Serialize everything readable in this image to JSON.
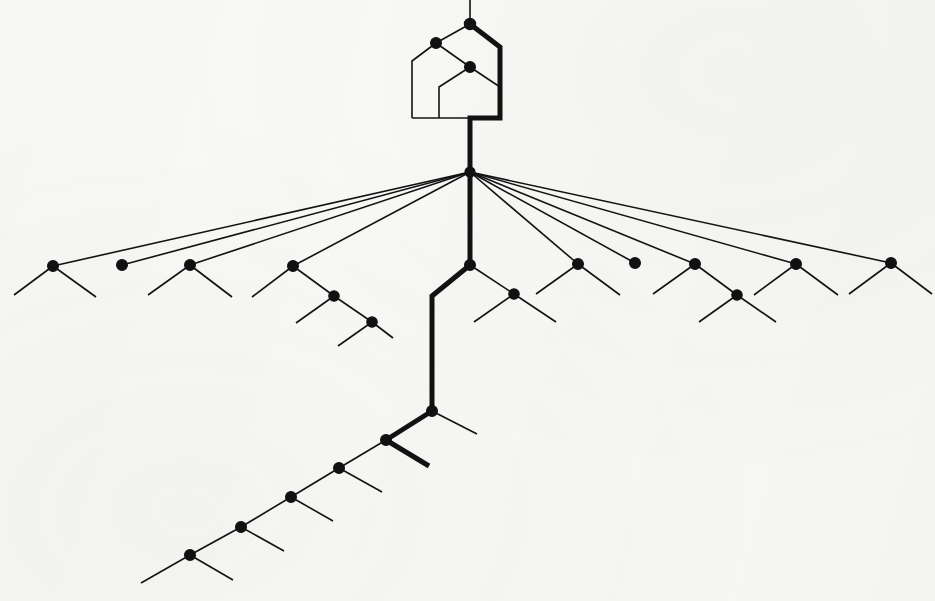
{
  "figure": {
    "title": "Hierarchical branching tree diagram",
    "background_color": "#f9f9f7",
    "ink_color": "#121212",
    "node_color": "#111111",
    "width": 935,
    "height": 601
  },
  "chart_data": {
    "type": "diagram",
    "title": "Hierarchical branching tree diagram",
    "subtitle": "",
    "xlabel": "",
    "ylabel": "",
    "grid": false,
    "legend_position": "none",
    "annotations": [],
    "style": {
      "thin_stroke_width": 1.6,
      "bold_stroke_width": 5.0,
      "node_radius": 5.2,
      "line_cap": "butt",
      "line_join": "miter"
    },
    "nodes": [
      {
        "id": "n_top",
        "x": 470,
        "y": 24,
        "label": "",
        "filled": true,
        "radius": 5.6
      },
      {
        "id": "n_upper_left",
        "x": 436,
        "y": 43,
        "label": "",
        "filled": true,
        "radius": 5.4
      },
      {
        "id": "n_upper_mid",
        "x": 470,
        "y": 67,
        "label": "",
        "filled": true,
        "radius": 5.4
      },
      {
        "id": "n_hub",
        "x": 470,
        "y": 172,
        "label": "",
        "filled": true,
        "radius": 5.0
      },
      {
        "id": "f1",
        "x": 53,
        "y": 266,
        "label": "",
        "filled": true,
        "radius": 5.4
      },
      {
        "id": "f2",
        "x": 122,
        "y": 265,
        "label": "",
        "filled": true,
        "radius": 5.4
      },
      {
        "id": "f3",
        "x": 190,
        "y": 265,
        "label": "",
        "filled": true,
        "radius": 5.4
      },
      {
        "id": "f4",
        "x": 293,
        "y": 266,
        "label": "",
        "filled": true,
        "radius": 5.4
      },
      {
        "id": "f4b",
        "x": 334,
        "y": 296,
        "label": "",
        "filled": true,
        "radius": 5.2
      },
      {
        "id": "f4c",
        "x": 372,
        "y": 322,
        "label": "",
        "filled": true,
        "radius": 5.2
      },
      {
        "id": "c1",
        "x": 470,
        "y": 265,
        "label": "",
        "filled": true,
        "radius": 5.4
      },
      {
        "id": "r1",
        "x": 514,
        "y": 294,
        "label": "",
        "filled": true,
        "radius": 5.2
      },
      {
        "id": "r2",
        "x": 578,
        "y": 264,
        "label": "",
        "filled": true,
        "radius": 5.4
      },
      {
        "id": "r3",
        "x": 635,
        "y": 263,
        "label": "",
        "filled": true,
        "radius": 5.4
      },
      {
        "id": "r4",
        "x": 695,
        "y": 264,
        "label": "",
        "filled": true,
        "radius": 5.4
      },
      {
        "id": "r4b",
        "x": 737,
        "y": 295,
        "label": "",
        "filled": true,
        "radius": 5.2
      },
      {
        "id": "r5",
        "x": 796,
        "y": 264,
        "label": "",
        "filled": true,
        "radius": 5.4
      },
      {
        "id": "r6",
        "x": 891,
        "y": 263,
        "label": "",
        "filled": true,
        "radius": 5.4
      },
      {
        "id": "m1",
        "x": 432,
        "y": 411,
        "label": "",
        "filled": true,
        "radius": 5.4
      },
      {
        "id": "m2",
        "x": 386,
        "y": 440,
        "label": "",
        "filled": true,
        "radius": 5.4
      },
      {
        "id": "d1",
        "x": 339,
        "y": 468,
        "label": "",
        "filled": true,
        "radius": 5.4
      },
      {
        "id": "d2",
        "x": 291,
        "y": 497,
        "label": "",
        "filled": true,
        "radius": 5.4
      },
      {
        "id": "d3",
        "x": 241,
        "y": 527,
        "label": "",
        "filled": true,
        "radius": 5.4
      },
      {
        "id": "d4",
        "x": 190,
        "y": 555,
        "label": "",
        "filled": true,
        "radius": 5.4
      }
    ],
    "bold_paths": [
      {
        "id": "bold-spine-upper",
        "points": [
          [
            470,
            24
          ],
          [
            500,
            47
          ],
          [
            500,
            118
          ],
          [
            470,
            118
          ],
          [
            470,
            172
          ]
        ]
      },
      {
        "id": "bold-spine-mid",
        "points": [
          [
            470,
            172
          ],
          [
            470,
            265
          ]
        ]
      },
      {
        "id": "bold-spine-lower",
        "points": [
          [
            470,
            265
          ],
          [
            432,
            296
          ],
          [
            432,
            411
          ]
        ]
      },
      {
        "id": "bold-spine-branch",
        "points": [
          [
            432,
            411
          ],
          [
            386,
            440
          ]
        ]
      },
      {
        "id": "bold-stub",
        "points": [
          [
            386,
            440
          ],
          [
            429,
            466
          ]
        ]
      }
    ],
    "thin_paths": [
      {
        "id": "stem-top",
        "points": [
          [
            470,
            24
          ],
          [
            470,
            0
          ]
        ]
      },
      {
        "id": "house-left-arm",
        "points": [
          [
            470,
            24
          ],
          [
            436,
            43
          ]
        ]
      },
      {
        "id": "house-left-side",
        "points": [
          [
            436,
            43
          ],
          [
            412,
            61
          ],
          [
            412,
            118
          ]
        ]
      },
      {
        "id": "house-mid-arm",
        "points": [
          [
            436,
            43
          ],
          [
            470,
            67
          ]
        ]
      },
      {
        "id": "house-inner-v",
        "points": [
          [
            470,
            67
          ],
          [
            439,
            87
          ],
          [
            439,
            118
          ]
        ]
      },
      {
        "id": "house-right-arm",
        "points": [
          [
            470,
            67
          ],
          [
            500,
            87
          ]
        ]
      },
      {
        "id": "house-base",
        "points": [
          [
            412,
            118
          ],
          [
            500,
            118
          ]
        ]
      },
      {
        "id": "fan-1",
        "points": [
          [
            470,
            172
          ],
          [
            53,
            266
          ]
        ]
      },
      {
        "id": "fan-2",
        "points": [
          [
            470,
            172
          ],
          [
            122,
            265
          ]
        ]
      },
      {
        "id": "fan-3",
        "points": [
          [
            470,
            172
          ],
          [
            190,
            265
          ]
        ]
      },
      {
        "id": "fan-4",
        "points": [
          [
            470,
            172
          ],
          [
            293,
            266
          ]
        ]
      },
      {
        "id": "fan-5",
        "points": [
          [
            470,
            172
          ],
          [
            578,
            264
          ]
        ]
      },
      {
        "id": "fan-6",
        "points": [
          [
            470,
            172
          ],
          [
            635,
            263
          ]
        ]
      },
      {
        "id": "fan-7",
        "points": [
          [
            470,
            172
          ],
          [
            695,
            264
          ]
        ]
      },
      {
        "id": "fan-8",
        "points": [
          [
            470,
            172
          ],
          [
            796,
            264
          ]
        ]
      },
      {
        "id": "fan-9",
        "points": [
          [
            470,
            172
          ],
          [
            891,
            263
          ]
        ]
      },
      {
        "id": "f1-left",
        "points": [
          [
            53,
            266
          ],
          [
            14,
            295
          ]
        ]
      },
      {
        "id": "f1-right",
        "points": [
          [
            53,
            266
          ],
          [
            96,
            297
          ]
        ]
      },
      {
        "id": "f3-left",
        "points": [
          [
            190,
            265
          ],
          [
            148,
            295
          ]
        ]
      },
      {
        "id": "f3-right",
        "points": [
          [
            190,
            265
          ],
          [
            232,
            297
          ]
        ]
      },
      {
        "id": "f4-left",
        "points": [
          [
            293,
            266
          ],
          [
            252,
            297
          ]
        ]
      },
      {
        "id": "f4-chain",
        "points": [
          [
            293,
            266
          ],
          [
            334,
            296
          ]
        ]
      },
      {
        "id": "f4b-left",
        "points": [
          [
            334,
            296
          ],
          [
            296,
            323
          ]
        ]
      },
      {
        "id": "f4b-chain",
        "points": [
          [
            334,
            296
          ],
          [
            372,
            322
          ]
        ]
      },
      {
        "id": "f4c-left",
        "points": [
          [
            372,
            322
          ],
          [
            338,
            346
          ]
        ]
      },
      {
        "id": "f4c-right",
        "points": [
          [
            372,
            322
          ],
          [
            393,
            338
          ]
        ]
      },
      {
        "id": "c1-right",
        "points": [
          [
            470,
            265
          ],
          [
            514,
            294
          ]
        ]
      },
      {
        "id": "r1-left",
        "points": [
          [
            514,
            294
          ],
          [
            474,
            322
          ]
        ]
      },
      {
        "id": "r1-right",
        "points": [
          [
            514,
            294
          ],
          [
            556,
            322
          ]
        ]
      },
      {
        "id": "r2-left",
        "points": [
          [
            578,
            264
          ],
          [
            536,
            294
          ]
        ]
      },
      {
        "id": "r2-right",
        "points": [
          [
            578,
            264
          ],
          [
            620,
            295
          ]
        ]
      },
      {
        "id": "r4-left",
        "points": [
          [
            695,
            264
          ],
          [
            653,
            294
          ]
        ]
      },
      {
        "id": "r4-chain",
        "points": [
          [
            695,
            264
          ],
          [
            737,
            295
          ]
        ]
      },
      {
        "id": "r4b-left",
        "points": [
          [
            737,
            295
          ],
          [
            699,
            322
          ]
        ]
      },
      {
        "id": "r4b-right",
        "points": [
          [
            737,
            295
          ],
          [
            776,
            322
          ]
        ]
      },
      {
        "id": "r5-left",
        "points": [
          [
            796,
            264
          ],
          [
            754,
            295
          ]
        ]
      },
      {
        "id": "r5-right",
        "points": [
          [
            796,
            264
          ],
          [
            838,
            295
          ]
        ]
      },
      {
        "id": "r6-left",
        "points": [
          [
            891,
            263
          ],
          [
            849,
            294
          ]
        ]
      },
      {
        "id": "r6-right",
        "points": [
          [
            891,
            263
          ],
          [
            932,
            294
          ]
        ]
      },
      {
        "id": "m1-right",
        "points": [
          [
            432,
            411
          ],
          [
            477,
            434
          ]
        ]
      },
      {
        "id": "chain-d1-m2",
        "points": [
          [
            339,
            468
          ],
          [
            386,
            440
          ]
        ]
      },
      {
        "id": "d1-right",
        "points": [
          [
            339,
            468
          ],
          [
            382,
            492
          ]
        ]
      },
      {
        "id": "chain-d2-d1",
        "points": [
          [
            291,
            497
          ],
          [
            339,
            468
          ]
        ]
      },
      {
        "id": "d2-right",
        "points": [
          [
            291,
            497
          ],
          [
            333,
            521
          ]
        ]
      },
      {
        "id": "chain-d3-d2",
        "points": [
          [
            241,
            527
          ],
          [
            291,
            497
          ]
        ]
      },
      {
        "id": "d3-right",
        "points": [
          [
            241,
            527
          ],
          [
            284,
            551
          ]
        ]
      },
      {
        "id": "chain-d4-d3",
        "points": [
          [
            190,
            555
          ],
          [
            241,
            527
          ]
        ]
      },
      {
        "id": "d4-right",
        "points": [
          [
            190,
            555
          ],
          [
            233,
            580
          ]
        ]
      },
      {
        "id": "d4-left",
        "points": [
          [
            190,
            555
          ],
          [
            141,
            583
          ]
        ]
      }
    ]
  }
}
